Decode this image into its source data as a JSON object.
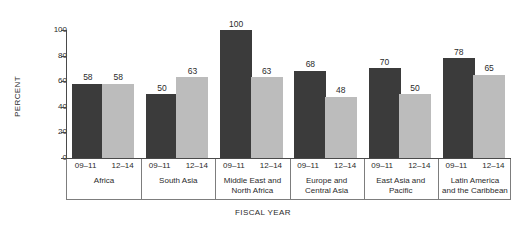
{
  "chart_data": {
    "type": "bar",
    "title": "",
    "xlabel": "FISCAL YEAR",
    "ylabel": "PERCENT",
    "ylim": [
      0,
      100
    ],
    "yticks": [
      0,
      20,
      40,
      60,
      80,
      100
    ],
    "grid": false,
    "legend": "none",
    "categories": [
      "Africa",
      "South Asia",
      "Middle East and North Africa",
      "Europe and Central Asia",
      "East Asia and Pacific",
      "Latin America and the Caribbean"
    ],
    "subcategories": [
      "09–11",
      "12–14"
    ],
    "series": [
      {
        "name": "09–11",
        "color": "#3b3b3b",
        "values": [
          58,
          50,
          100,
          68,
          70,
          78
        ]
      },
      {
        "name": "12–14",
        "color": "#bcbcbc",
        "values": [
          58,
          63,
          63,
          48,
          50,
          65
        ]
      }
    ]
  },
  "groups": [
    {
      "name_lines": [
        "Africa"
      ],
      "bars": [
        {
          "period": "09–11",
          "value": 58,
          "shade": "dark"
        },
        {
          "period": "12–14",
          "value": 58,
          "shade": "light"
        }
      ]
    },
    {
      "name_lines": [
        "South Asia"
      ],
      "bars": [
        {
          "period": "09–11",
          "value": 50,
          "shade": "dark"
        },
        {
          "period": "12–14",
          "value": 63,
          "shade": "light"
        }
      ]
    },
    {
      "name_lines": [
        "Middle East and",
        "North Africa"
      ],
      "bars": [
        {
          "period": "09–11",
          "value": 100,
          "shade": "dark"
        },
        {
          "period": "12–14",
          "value": 63,
          "shade": "light"
        }
      ]
    },
    {
      "name_lines": [
        "Europe and",
        "Central Asia"
      ],
      "bars": [
        {
          "period": "09–11",
          "value": 68,
          "shade": "dark"
        },
        {
          "period": "12–14",
          "value": 48,
          "shade": "light"
        }
      ]
    },
    {
      "name_lines": [
        "East Asia and",
        "Pacific"
      ],
      "bars": [
        {
          "period": "09–11",
          "value": 70,
          "shade": "dark"
        },
        {
          "period": "12–14",
          "value": 50,
          "shade": "light"
        }
      ]
    },
    {
      "name_lines": [
        "Latin America",
        "and the Caribbean"
      ],
      "bars": [
        {
          "period": "09–11",
          "value": 78,
          "shade": "dark"
        },
        {
          "period": "12–14",
          "value": 65,
          "shade": "light"
        }
      ]
    }
  ],
  "axes": {
    "y_title": "PERCENT",
    "x_title": "FISCAL YEAR",
    "y_ticks": [
      "100",
      "80",
      "60",
      "40",
      "20",
      "0"
    ]
  },
  "colors": {
    "bar_dark": "#3b3b3b",
    "bar_light": "#bcbcbc",
    "axis": "#4a4a4a",
    "rule": "#7d7d7d",
    "text": "#2b2b2b",
    "background": "#ffffff"
  }
}
